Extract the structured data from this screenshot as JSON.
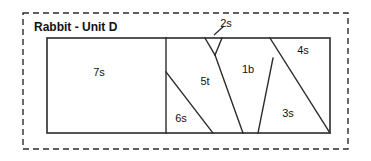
{
  "diagram": {
    "title": "Rabbit - Unit D",
    "outer_border": {
      "x": 23,
      "y": 13,
      "width": 325,
      "height": 136,
      "style": "dashed"
    },
    "plot_rect": {
      "x": 47,
      "y": 38,
      "width": 283,
      "height": 95
    },
    "stroke_color": "#2b2b2b",
    "background_color": "#ffffff",
    "pieces": [
      {
        "id": "piece-7s",
        "label": "7s",
        "label_x": 99,
        "label_y": 73,
        "outline": "47,38 166,38 166,133 47,133"
      },
      {
        "id": "piece-6s",
        "label": "6s",
        "label_x": 181,
        "label_y": 119,
        "outline": "166,72 213,133 166,133"
      },
      {
        "id": "piece-5t",
        "label": "5t",
        "label_x": 205,
        "label_y": 82,
        "outline": "166,38 205,38 215,55 243,133 213,133 166,72"
      },
      {
        "id": "piece-2s",
        "label": "2s",
        "label_x": 226,
        "label_y": 24,
        "outline": "205,38 222,38 215,55"
      },
      {
        "id": "piece-1b",
        "label": "1b",
        "label_x": 248,
        "label_y": 70,
        "outline": "222,38 270,38 273,58 258,133 243,133 215,55"
      },
      {
        "id": "piece-3s",
        "label": "3s",
        "label_x": 288,
        "label_y": 114,
        "outline": "273,58 330,133 258,133"
      },
      {
        "id": "piece-4s",
        "label": "4s",
        "label_x": 303,
        "label_y": 51,
        "outline": "270,38 330,38 330,133 273,58"
      }
    ],
    "cut_lines": [
      {
        "id": "cut-7s-divider",
        "d": "M 166,38 L 166,133"
      },
      {
        "id": "cut-6s-diagonal",
        "d": "M 166,72 L 213,133"
      },
      {
        "id": "cut-5t-1b",
        "d": "M 215,55 L 243,133"
      },
      {
        "id": "cut-wedge-left",
        "d": "M 205,38 L 215,55"
      },
      {
        "id": "cut-wedge-right",
        "d": "M 222,38 L 215,55"
      },
      {
        "id": "cut-1b-3s",
        "d": "M 273,58 L 258,133"
      },
      {
        "id": "cut-4s-3s",
        "d": "M 270,38 L 330,133"
      }
    ],
    "leader_lines": [
      {
        "id": "leader-2s",
        "d": "M 214,35 L 224,26"
      }
    ],
    "title_position": {
      "x": 34,
      "y": 31
    }
  }
}
